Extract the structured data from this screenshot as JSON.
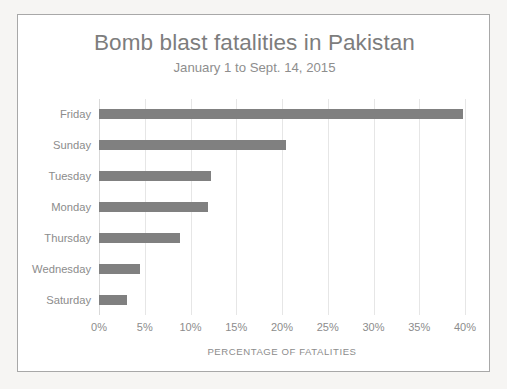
{
  "chart_data": {
    "type": "bar",
    "orientation": "horizontal",
    "title": "Bomb blast fatalities in Pakistan",
    "subtitle": "January 1 to Sept. 14, 2015",
    "xlabel": "PERCENTAGE OF FATALITIES",
    "ylabel": "",
    "categories": [
      "Friday",
      "Sunday",
      "Tuesday",
      "Monday",
      "Thursday",
      "Wednesday",
      "Saturday"
    ],
    "values": [
      39.8,
      20.4,
      12.2,
      11.9,
      8.9,
      4.5,
      3.1
    ],
    "xlim": [
      0,
      40
    ],
    "xtick_values": [
      0,
      5,
      10,
      15,
      20,
      25,
      30,
      35,
      40
    ],
    "xtick_labels": [
      "0%",
      "5%",
      "10%",
      "15%",
      "20%",
      "25%",
      "30%",
      "35%",
      "40%"
    ],
    "grid": "vertical",
    "legend": "none",
    "bar_color": "#808080",
    "gridline_color": "#e6e6e6",
    "text_color": "#8c8c8c",
    "title_color": "#7d7d7d",
    "frame_color": "#a8a8a8",
    "background_color": "#ffffff",
    "page_background_color": "#f6f5f3"
  }
}
